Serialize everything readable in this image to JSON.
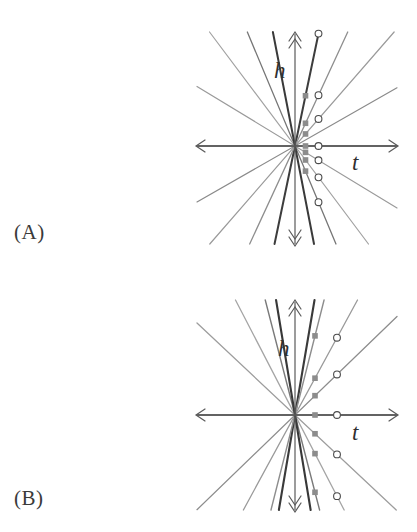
{
  "figure": {
    "panels": [
      {
        "id": "A",
        "label": "(A)",
        "axis_labels": {
          "vertical": "h",
          "horizontal": "t"
        },
        "axis_color": "#555555",
        "square_color": "#8c8c8c",
        "circle_stroke": "#4a4a4a"
      },
      {
        "id": "B",
        "label": "(B)",
        "axis_labels": {
          "vertical": "h",
          "horizontal": "t"
        },
        "axis_color": "#555555",
        "square_color": "#8c8c8c",
        "circle_stroke": "#4a4a4a"
      }
    ]
  },
  "chart_data": [
    {
      "type": "line",
      "title": "",
      "subtitle": "",
      "panel": "A",
      "xlabel": "t",
      "ylabel": "h",
      "xlim": [
        -1.0,
        1.0
      ],
      "ylim": [
        -1.14,
        1.14
      ],
      "grid": false,
      "legend": "none",
      "description": "Pencil of straight lines through the origin; filled square markers mark intersections with the near vertical line t = 0.105; open circle markers mark intersections with the far vertical line t = 0.235.",
      "origin": [
        0,
        0
      ],
      "marker_lines": {
        "squares_at_t": 0.105,
        "circles_at_t": 0.235
      },
      "series": [
        {
          "name": "line-1",
          "slope": 5.2,
          "shade": "#3d3d3d",
          "width": 2.0
        },
        {
          "name": "line-2",
          "slope": 2.35,
          "shade": "#8e8e8e",
          "width": 1.3
        },
        {
          "name": "line-3",
          "slope": 1.25,
          "shade": "#9a9a9a",
          "width": 1.2
        },
        {
          "name": "line-4",
          "slope": 0.62,
          "shade": "#8a8a8a",
          "width": 1.2
        },
        {
          "name": "line-5",
          "slope": 0.0,
          "shade": "#555555",
          "width": 1.4
        },
        {
          "name": "line-6",
          "slope": -0.66,
          "shade": "#9a9a9a",
          "width": 1.2
        },
        {
          "name": "line-7",
          "slope": -1.45,
          "shade": "#a2a2a2",
          "width": 1.2
        },
        {
          "name": "line-8",
          "slope": -2.6,
          "shade": "#767676",
          "width": 1.3
        },
        {
          "name": "line-9",
          "slope": -5.6,
          "shade": "#3a3a3a",
          "width": 2.0
        }
      ],
      "square_points": [
        {
          "t": 0.105,
          "h": 0.546
        },
        {
          "t": 0.105,
          "h": 0.247
        },
        {
          "t": 0.105,
          "h": 0.131
        },
        {
          "t": 0.105,
          "h": 0.0
        },
        {
          "t": 0.105,
          "h": -0.069
        },
        {
          "t": 0.105,
          "h": -0.152
        },
        {
          "t": 0.105,
          "h": -0.273
        }
      ],
      "circle_points": [
        {
          "t": 0.235,
          "h": 1.222
        },
        {
          "t": 0.235,
          "h": 0.552
        },
        {
          "t": 0.235,
          "h": 0.294
        },
        {
          "t": 0.235,
          "h": 0.0
        },
        {
          "t": 0.235,
          "h": -0.155
        },
        {
          "t": 0.235,
          "h": -0.341
        },
        {
          "t": 0.235,
          "h": -0.611
        }
      ]
    },
    {
      "type": "line",
      "title": "",
      "subtitle": "",
      "panel": "B",
      "xlabel": "t",
      "ylabel": "h",
      "xlim": [
        -1.0,
        1.0
      ],
      "ylim": [
        -1.12,
        1.12
      ],
      "grid": false,
      "legend": "none",
      "description": "Pencil of straight lines through the origin with steeper slopes than panel A; filled square markers mark intersections with the near vertical line t = 0.20; open circle markers mark intersections with the far vertical line t = 0.42.",
      "origin": [
        0,
        0
      ],
      "marker_lines": {
        "squares_at_t": 0.2,
        "circles_at_t": 0.42
      },
      "series": [
        {
          "name": "line-1",
          "slope": 6.4,
          "shade": "#3a3a3a",
          "width": 2.1
        },
        {
          "name": "line-2",
          "slope": 4.3,
          "shade": "#8d8d8d",
          "width": 1.4
        },
        {
          "name": "line-3",
          "slope": 2.0,
          "shade": "#9a9a9a",
          "width": 1.3
        },
        {
          "name": "line-4",
          "slope": 1.05,
          "shade": "#8d8d8d",
          "width": 1.3
        },
        {
          "name": "line-5",
          "slope": 0.0,
          "shade": "#555555",
          "width": 1.4
        },
        {
          "name": "line-6",
          "slope": -1.02,
          "shade": "#9d9d9d",
          "width": 1.3
        },
        {
          "name": "line-7",
          "slope": -2.1,
          "shade": "#a5a5a5",
          "width": 1.3
        },
        {
          "name": "line-8",
          "slope": -4.2,
          "shade": "#7a7a7a",
          "width": 1.4
        },
        {
          "name": "line-9",
          "slope": -6.6,
          "shade": "#383838",
          "width": 2.1
        }
      ],
      "square_points": [
        {
          "t": 0.2,
          "h": 0.86
        },
        {
          "t": 0.2,
          "h": 0.4
        },
        {
          "t": 0.2,
          "h": 0.21
        },
        {
          "t": 0.2,
          "h": 0.0
        },
        {
          "t": 0.2,
          "h": -0.204
        },
        {
          "t": 0.2,
          "h": -0.42
        },
        {
          "t": 0.2,
          "h": -0.84
        }
      ],
      "circle_points": [
        {
          "t": 0.42,
          "h": 0.84
        },
        {
          "t": 0.42,
          "h": 0.441
        },
        {
          "t": 0.42,
          "h": 0.0
        },
        {
          "t": 0.42,
          "h": -0.428
        },
        {
          "t": 0.42,
          "h": -0.882
        }
      ]
    }
  ]
}
